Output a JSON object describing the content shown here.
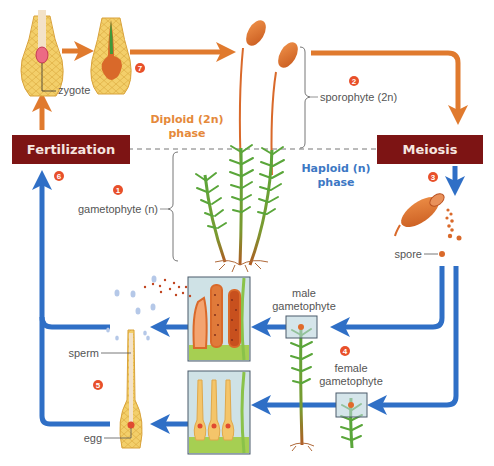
{
  "diagram": {
    "colors": {
      "diploid_arrow": "#e07a2e",
      "haploid_arrow": "#2f6fc6",
      "stage_box": "#7d1414",
      "stage_box_text": "#f6e6e0",
      "step_badge": "#e8502a",
      "diploid_text": "#e5893a",
      "haploid_text": "#3d78c4",
      "label_text": "#555555",
      "moss_green": "#5aa63a",
      "capsule_orange": "#d9692a",
      "tissue_yellow": "#f1c45c",
      "inset_bg": "#cfe2e6"
    },
    "stages": {
      "fertilization": "Fertilization",
      "meiosis": "Meiosis"
    },
    "phases": {
      "diploid_line1": "Diploid (2n)",
      "diploid_line2": "phase",
      "haploid_line1": "Haploid (n)",
      "haploid_line2": "phase"
    },
    "labels": {
      "zygote": "zygote",
      "sporophyte": "sporophyte (2n)",
      "gametophyte": "gametophyte (n)",
      "spore": "spore",
      "male_gametophyte_1": "male",
      "male_gametophyte_2": "gametophyte",
      "female_gametophyte_1": "female",
      "female_gametophyte_2": "gametophyte",
      "sperm": "sperm",
      "egg": "egg"
    },
    "steps": [
      {
        "n": "1",
        "desc": "gametophyte (n)"
      },
      {
        "n": "2",
        "desc": "sporophyte (2n)"
      },
      {
        "n": "3",
        "desc": "spore release"
      },
      {
        "n": "4",
        "desc": "male and female gametophytes"
      },
      {
        "n": "5",
        "desc": "sperm reaches egg"
      },
      {
        "n": "6",
        "desc": "fertilization"
      },
      {
        "n": "7",
        "desc": "zygote develops"
      }
    ]
  }
}
